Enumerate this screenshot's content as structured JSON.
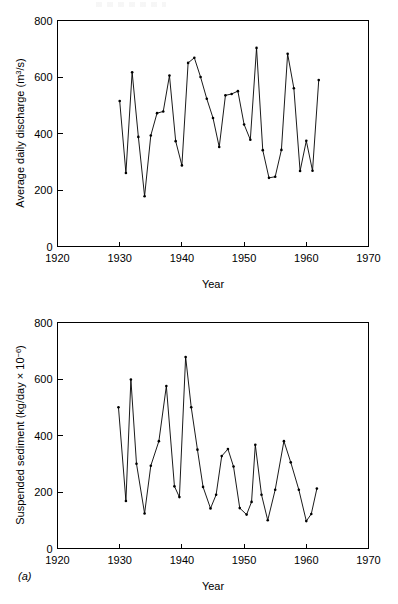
{
  "figure": {
    "panel_letter": "(a)"
  },
  "charts": [
    {
      "id": "discharge",
      "ylabel_main": "Average daily discharge (m",
      "ylabel_sup": "3",
      "ylabel_tail": "/s)",
      "xlabel": "Year",
      "xticks": [
        "1920",
        "1930",
        "1940",
        "1950",
        "1960",
        "1970"
      ],
      "yticks": [
        "0",
        "200",
        "400",
        "600",
        "800"
      ]
    },
    {
      "id": "sediment",
      "ylabel_main": "Suspended sediment (kg/day × 10",
      "ylabel_sup": "−6",
      "ylabel_tail": ")",
      "xlabel": "Year",
      "xticks": [
        "1920",
        "1930",
        "1940",
        "1950",
        "1960",
        "1970"
      ],
      "yticks": [
        "0",
        "200",
        "400",
        "600",
        "800"
      ]
    }
  ],
  "chart_data": [
    {
      "type": "line",
      "id": "discharge",
      "title": "",
      "xlabel": "Year",
      "ylabel": "Average daily discharge (m3/s)",
      "xlim": [
        1920,
        1970
      ],
      "ylim": [
        0,
        800
      ],
      "xticks": [
        1920,
        1930,
        1940,
        1950,
        1960,
        1970
      ],
      "yticks": [
        0,
        200,
        400,
        600,
        800
      ],
      "grid": false,
      "legend": "none",
      "markers": true,
      "x": [
        1930,
        1931,
        1932,
        1933,
        1934,
        1935,
        1936,
        1937,
        1938,
        1939,
        1940,
        1941,
        1942,
        1943,
        1944,
        1945,
        1946,
        1947,
        1948,
        1949,
        1950,
        1951,
        1952,
        1953,
        1954,
        1955,
        1956,
        1957,
        1958,
        1959,
        1960,
        1961,
        1962
      ],
      "y": [
        515,
        260,
        617,
        388,
        178,
        393,
        472,
        478,
        605,
        373,
        287,
        650,
        668,
        600,
        523,
        455,
        352,
        535,
        540,
        550,
        432,
        378,
        703,
        341,
        243,
        247,
        342,
        682,
        560,
        267,
        374,
        268,
        589
      ],
      "series": [
        {
          "name": "Average daily discharge",
          "values": [
            515,
            260,
            617,
            388,
            178,
            393,
            472,
            478,
            605,
            373,
            287,
            650,
            668,
            600,
            523,
            455,
            352,
            535,
            540,
            550,
            432,
            378,
            703,
            341,
            243,
            247,
            342,
            682,
            560,
            267,
            374,
            268,
            589
          ]
        }
      ]
    },
    {
      "type": "line",
      "id": "sediment",
      "title": "",
      "xlabel": "Year",
      "ylabel": "Suspended sediment (kg/day x 10-6)",
      "xlim": [
        1920,
        1970
      ],
      "ylim": [
        0,
        800
      ],
      "xticks": [
        1920,
        1930,
        1940,
        1950,
        1960,
        1970
      ],
      "yticks": [
        0,
        200,
        400,
        600,
        800
      ],
      "grid": false,
      "legend": "none",
      "markers": true,
      "x": [
        1929.8,
        1931,
        1931.8,
        1932.7,
        1934,
        1935,
        1936.3,
        1937.5,
        1938.8,
        1939.6,
        1940.6,
        1941.5,
        1942.5,
        1943.4,
        1944.6,
        1945.5,
        1946.4,
        1947.4,
        1948.3,
        1949.3,
        1950.4,
        1951.2,
        1951.8,
        1952.8,
        1953.8,
        1955,
        1956.4,
        1957.5,
        1958.8,
        1960,
        1960.8,
        1961.7
      ],
      "y": [
        500,
        168,
        598,
        300,
        124,
        293,
        380,
        575,
        220,
        182,
        678,
        500,
        350,
        218,
        142,
        190,
        327,
        352,
        290,
        143,
        120,
        165,
        367,
        190,
        100,
        208,
        380,
        305,
        208,
        97,
        122,
        212
      ],
      "series": [
        {
          "name": "Suspended sediment",
          "values": [
            500,
            168,
            598,
            300,
            124,
            293,
            380,
            575,
            220,
            182,
            678,
            500,
            350,
            218,
            142,
            190,
            327,
            352,
            290,
            143,
            120,
            165,
            367,
            190,
            100,
            208,
            380,
            305,
            208,
            97,
            122,
            212
          ]
        }
      ]
    }
  ]
}
